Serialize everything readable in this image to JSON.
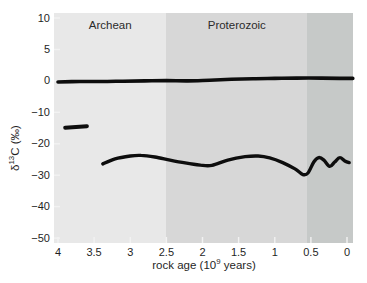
{
  "labels": {
    "x_title_prefix": "rock age (10",
    "x_title_sup": "9",
    "x_title_suffix": " years)",
    "y_title_prefix": "δ",
    "y_title_sup": "13",
    "y_title_suffix": "C (‰)"
  },
  "colors": {
    "background": "#ffffff",
    "curve": "#0d0d0d",
    "tick_mark": "#f2f2f2",
    "text": "#1f1f1f"
  },
  "chart_data": {
    "type": "line",
    "title": "",
    "xlabel": "rock age (10⁹ years)",
    "ylabel": "δ¹³C (‰)",
    "x_axis_reversed": true,
    "x_ticks": [
      4,
      3.5,
      3,
      2.5,
      2,
      1.5,
      1,
      0.5,
      0
    ],
    "x_tick_labels": [
      "4",
      "3.5",
      "3",
      "2.5",
      "2",
      "1.5",
      "1",
      "0.5",
      "0"
    ],
    "y_ticks": [
      10,
      5,
      0,
      -10,
      -20,
      -30,
      -40,
      -50
    ],
    "y_tick_labels": [
      "10",
      "5",
      "0",
      "−10",
      "−20",
      "−30",
      "−40",
      "−50"
    ],
    "y_axis_scale_note": "nonlinear axis: ticks equally spaced on page, 5-unit steps above 0 and 10-unit steps below 0",
    "grid": false,
    "legend": false,
    "eras": [
      {
        "name": "Archean",
        "start_Ga": 4.06,
        "end_Ga": 2.5,
        "band_color": "#e8e8e8"
      },
      {
        "name": "Proterozoic",
        "start_Ga": 2.5,
        "end_Ga": 0.55,
        "band_color": "#d7d7d7"
      },
      {
        "name": "",
        "start_Ga": 0.55,
        "end_Ga": -0.08,
        "band_color": "#c6c9c8"
      }
    ],
    "series": [
      {
        "name": "carbonate carbon line (δ¹³C ≈ 0)",
        "stroke_width": 3.6,
        "points": [
          [
            4.0,
            -0.35
          ],
          [
            3.7,
            -0.2
          ],
          [
            3.4,
            -0.2
          ],
          [
            3.1,
            -0.1
          ],
          [
            2.8,
            0.0
          ],
          [
            2.5,
            0.05
          ],
          [
            2.2,
            0.0
          ],
          [
            1.9,
            0.1
          ],
          [
            1.6,
            0.25
          ],
          [
            1.3,
            0.35
          ],
          [
            1.0,
            0.4
          ],
          [
            0.7,
            0.45
          ],
          [
            0.35,
            0.45
          ],
          [
            0.0,
            0.4
          ],
          [
            -0.08,
            0.4
          ]
        ]
      },
      {
        "name": "early Archean organic carbon segment (δ¹³C ≈ −14.5)",
        "stroke_width": 4,
        "points": [
          [
            3.9,
            -14.9
          ],
          [
            3.6,
            -14.4
          ]
        ]
      },
      {
        "name": "organic carbon line (δ¹³C ≈ −25)",
        "stroke_width": 3.4,
        "points": [
          [
            3.38,
            -26.4
          ],
          [
            3.21,
            -24.8
          ],
          [
            3.0,
            -23.9
          ],
          [
            2.85,
            -23.7
          ],
          [
            2.66,
            -24.2
          ],
          [
            2.45,
            -25.2
          ],
          [
            2.24,
            -26.1
          ],
          [
            2.03,
            -26.8
          ],
          [
            1.87,
            -26.9
          ],
          [
            1.65,
            -25.2
          ],
          [
            1.41,
            -24.1
          ],
          [
            1.23,
            -23.9
          ],
          [
            1.07,
            -24.5
          ],
          [
            0.89,
            -26.0
          ],
          [
            0.72,
            -28.0
          ],
          [
            0.61,
            -29.8
          ],
          [
            0.54,
            -29.3
          ],
          [
            0.46,
            -25.8
          ],
          [
            0.39,
            -24.4
          ],
          [
            0.32,
            -25.2
          ],
          [
            0.24,
            -27.2
          ],
          [
            0.17,
            -25.8
          ],
          [
            0.1,
            -24.4
          ],
          [
            0.03,
            -25.5
          ],
          [
            -0.03,
            -26.0
          ]
        ]
      }
    ]
  }
}
